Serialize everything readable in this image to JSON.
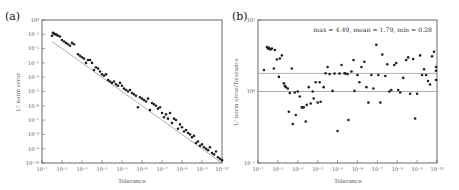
{
  "figure": {
    "panels": [
      {
        "id": "a",
        "label": "(a)"
      },
      {
        "id": "b",
        "label": "(b)"
      }
    ]
  },
  "chart_data": [
    {
      "panel": "(a)",
      "type": "scatter",
      "title": "",
      "xlabel": "Tolerance",
      "ylabel": "L² norm error",
      "xscale": "log",
      "yscale": "log",
      "xlim": [
        0.1,
        1e-10
      ],
      "ylim": [
        1e-10,
        1.0
      ],
      "x_axis_inverted": true,
      "grid": false,
      "xticks": [
        "10⁻¹",
        "10⁻²",
        "10⁻³",
        "10⁻⁴",
        "10⁻⁵",
        "10⁻⁶",
        "10⁻⁷",
        "10⁻⁸",
        "10⁻⁹",
        "10⁻¹⁰"
      ],
      "yticks": [
        "10⁰",
        "10⁻¹",
        "10⁻²",
        "10⁻³",
        "10⁻⁴",
        "10⁻⁵",
        "10⁻⁶",
        "10⁻⁷",
        "10⁻⁸",
        "10⁻⁹",
        "10⁻¹⁰"
      ],
      "reference_line": {
        "label": "error = tolerance",
        "color": "#999999",
        "x": [
          0.03,
          1e-10
        ],
        "y": [
          0.03,
          1e-10
        ]
      },
      "series": [
        {
          "name": "L2 norm error",
          "marker_color": "#222222",
          "points_log10": [
            [
              -1.5,
              -1.1
            ],
            [
              -1.55,
              -0.9
            ],
            [
              -1.6,
              -0.95
            ],
            [
              -1.65,
              -1.0
            ],
            [
              -1.7,
              -1.0
            ],
            [
              -1.75,
              -1.05
            ],
            [
              -1.8,
              -1.1
            ],
            [
              -1.9,
              -1.15
            ],
            [
              -2.0,
              -1.4
            ],
            [
              -2.1,
              -1.5
            ],
            [
              -2.2,
              -1.6
            ],
            [
              -2.3,
              -1.7
            ],
            [
              -2.4,
              -1.8
            ],
            [
              -2.5,
              -1.6
            ],
            [
              -2.6,
              -1.7
            ],
            [
              -2.8,
              -2.4
            ],
            [
              -2.9,
              -2.5
            ],
            [
              -3.0,
              -2.6
            ],
            [
              -3.1,
              -2.7
            ],
            [
              -3.2,
              -3.0
            ],
            [
              -3.3,
              -2.8
            ],
            [
              -3.4,
              -2.8
            ],
            [
              -3.5,
              -3.0
            ],
            [
              -3.6,
              -3.5
            ],
            [
              -3.7,
              -3.3
            ],
            [
              -3.8,
              -3.4
            ],
            [
              -3.9,
              -3.6
            ],
            [
              -4.0,
              -3.8
            ],
            [
              -4.1,
              -3.9
            ],
            [
              -4.2,
              -3.8
            ],
            [
              -4.3,
              -4.2
            ],
            [
              -4.4,
              -4.3
            ],
            [
              -4.5,
              -4.4
            ],
            [
              -4.6,
              -4.3
            ],
            [
              -4.7,
              -4.5
            ],
            [
              -4.8,
              -4.6
            ],
            [
              -4.9,
              -4.4
            ],
            [
              -5.0,
              -4.6
            ],
            [
              -5.1,
              -4.8
            ],
            [
              -5.2,
              -4.9
            ],
            [
              -5.3,
              -5.0
            ],
            [
              -5.4,
              -4.9
            ],
            [
              -5.5,
              -5.1
            ],
            [
              -5.6,
              -5.2
            ],
            [
              -5.7,
              -5.3
            ],
            [
              -5.8,
              -6.1
            ],
            [
              -5.9,
              -5.4
            ],
            [
              -6.0,
              -5.5
            ],
            [
              -6.1,
              -5.6
            ],
            [
              -6.2,
              -5.7
            ],
            [
              -6.3,
              -5.5
            ],
            [
              -6.4,
              -6.3
            ],
            [
              -6.5,
              -5.8
            ],
            [
              -6.6,
              -5.9
            ],
            [
              -6.7,
              -6.0
            ],
            [
              -6.8,
              -6.2
            ],
            [
              -6.9,
              -6.1
            ],
            [
              -7.0,
              -6.5
            ],
            [
              -7.1,
              -6.8
            ],
            [
              -7.2,
              -6.6
            ],
            [
              -7.3,
              -6.9
            ],
            [
              -7.4,
              -6.5
            ],
            [
              -7.5,
              -7.2
            ],
            [
              -7.6,
              -6.9
            ],
            [
              -7.7,
              -7.0
            ],
            [
              -7.8,
              -7.6
            ],
            [
              -7.9,
              -7.3
            ],
            [
              -8.0,
              -7.5
            ],
            [
              -8.1,
              -7.8
            ],
            [
              -8.2,
              -7.7
            ],
            [
              -8.3,
              -7.9
            ],
            [
              -8.4,
              -8.0
            ],
            [
              -8.5,
              -8.2
            ],
            [
              -8.6,
              -8.1
            ],
            [
              -8.7,
              -8.6
            ],
            [
              -8.8,
              -8.5
            ],
            [
              -8.9,
              -8.8
            ],
            [
              -9.0,
              -8.7
            ],
            [
              -9.1,
              -8.9
            ],
            [
              -9.2,
              -9.0
            ],
            [
              -9.3,
              -9.1
            ],
            [
              -9.4,
              -8.9
            ],
            [
              -9.5,
              -9.3
            ],
            [
              -9.6,
              -9.4
            ],
            [
              -9.7,
              -9.2
            ],
            [
              -9.8,
              -9.6
            ],
            [
              -9.9,
              -9.7
            ],
            [
              -10.0,
              -9.8
            ]
          ]
        }
      ]
    },
    {
      "panel": "(b)",
      "type": "scatter",
      "title": "",
      "xlabel": "Tolerance",
      "ylabel": "L² norm error/Tolerance",
      "xscale": "log",
      "yscale": "log",
      "xlim": [
        0.1,
        1e-10
      ],
      "ylim": [
        0.1,
        10.0
      ],
      "x_axis_inverted": true,
      "grid": false,
      "xticks": [
        "10⁻¹",
        "10⁻²",
        "10⁻³",
        "10⁻⁴",
        "10⁻⁵",
        "10⁻⁶",
        "10⁻⁷",
        "10⁻⁸",
        "10⁻⁹",
        "10⁻¹⁰"
      ],
      "yticks": [
        "10¹",
        "10⁰",
        "10⁻¹"
      ],
      "annotation": "max = 4.49, mean = 1.79, min = 0.28",
      "stats": {
        "max": 4.49,
        "mean": 1.79,
        "min": 0.28
      },
      "horizontal_lines": [
        {
          "label": "mean",
          "y": 1.79,
          "color": "#999999"
        },
        {
          "label": "unity",
          "y": 1.0,
          "color": "#999999"
        }
      ],
      "series": [
        {
          "name": "L2 norm error / Tolerance",
          "marker_color": "#222222",
          "points": [
            [
              -1.3,
              2.0
            ],
            [
              -1.45,
              4.2
            ],
            [
              -1.5,
              4.0
            ],
            [
              -1.55,
              4.1
            ],
            [
              -1.6,
              3.9
            ],
            [
              -1.65,
              3.9
            ],
            [
              -1.7,
              4.0
            ],
            [
              -1.8,
              2.1
            ],
            [
              -1.85,
              3.8
            ],
            [
              -1.95,
              2.8
            ],
            [
              -2.05,
              1.6
            ],
            [
              -2.1,
              2.9
            ],
            [
              -2.2,
              3.2
            ],
            [
              -2.3,
              1.3
            ],
            [
              -2.35,
              1.2
            ],
            [
              -2.4,
              1.15
            ],
            [
              -2.5,
              1.1
            ],
            [
              -2.55,
              0.52
            ],
            [
              -2.6,
              0.95
            ],
            [
              -2.7,
              2.1
            ],
            [
              -2.75,
              0.35
            ],
            [
              -2.85,
              0.97
            ],
            [
              -2.9,
              0.47
            ],
            [
              -3.0,
              1.0
            ],
            [
              -3.1,
              0.85
            ],
            [
              -3.2,
              0.6
            ],
            [
              -3.25,
              0.6
            ],
            [
              -3.3,
              0.6
            ],
            [
              -3.4,
              0.38
            ],
            [
              -3.45,
              0.65
            ],
            [
              -3.55,
              1.15
            ],
            [
              -3.65,
              0.68
            ],
            [
              -3.75,
              1.0
            ],
            [
              -3.8,
              0.8
            ],
            [
              -3.9,
              1.35
            ],
            [
              -4.0,
              0.7
            ],
            [
              -4.1,
              1.35
            ],
            [
              -4.15,
              0.72
            ],
            [
              -4.3,
              1.15
            ],
            [
              -4.4,
              1.8
            ],
            [
              -4.5,
              2.2
            ],
            [
              -4.6,
              1.75
            ],
            [
              -4.75,
              1.02
            ],
            [
              -4.85,
              1.78
            ],
            [
              -5.0,
              0.28
            ],
            [
              -5.1,
              1.78
            ],
            [
              -5.2,
              2.35
            ],
            [
              -5.35,
              1.8
            ],
            [
              -5.4,
              1.78
            ],
            [
              -5.5,
              1.75
            ],
            [
              -5.55,
              0.4
            ],
            [
              -5.7,
              1.9
            ],
            [
              -5.8,
              2.75
            ],
            [
              -5.85,
              1.02
            ],
            [
              -6.0,
              1.7
            ],
            [
              -6.1,
              1.35
            ],
            [
              -6.2,
              2.2
            ],
            [
              -6.35,
              2.6
            ],
            [
              -6.45,
              1.15
            ],
            [
              -6.55,
              0.7
            ],
            [
              -6.7,
              1.7
            ],
            [
              -6.8,
              1.1
            ],
            [
              -6.95,
              4.49
            ],
            [
              -7.05,
              1.7
            ],
            [
              -7.15,
              0.7
            ],
            [
              -7.25,
              3.3
            ],
            [
              -7.4,
              1.65
            ],
            [
              -7.5,
              2.4
            ],
            [
              -7.6,
              1.0
            ],
            [
              -7.7,
              1.05
            ],
            [
              -7.85,
              2.35
            ],
            [
              -7.95,
              2.5
            ],
            [
              -8.05,
              1.05
            ],
            [
              -8.15,
              0.97
            ],
            [
              -8.3,
              1.55
            ],
            [
              -8.45,
              2.75
            ],
            [
              -8.55,
              3.0
            ],
            [
              -8.65,
              0.93
            ],
            [
              -8.8,
              2.85
            ],
            [
              -8.9,
              0.42
            ],
            [
              -9.0,
              0.93
            ],
            [
              -9.15,
              3.2
            ],
            [
              -9.25,
              1.7
            ],
            [
              -9.35,
              2.05
            ],
            [
              -9.45,
              1.7
            ],
            [
              -9.55,
              1.4
            ],
            [
              -9.65,
              1.25
            ],
            [
              -9.75,
              3.1
            ],
            [
              -9.85,
              3.6
            ],
            [
              -9.95,
              1.45
            ],
            [
              -10.05,
              1.95
            ],
            [
              -10.1,
              2.2
            ]
          ]
        }
      ]
    }
  ]
}
